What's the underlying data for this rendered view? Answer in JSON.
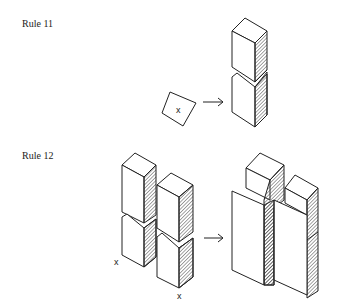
{
  "rules": [
    {
      "label": "Rule 11",
      "input_marker": "x"
    },
    {
      "label": "Rule 12",
      "markers": [
        "x",
        "x"
      ]
    }
  ],
  "colors": {
    "line": "#222222",
    "background": "#ffffff"
  }
}
